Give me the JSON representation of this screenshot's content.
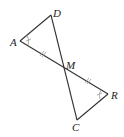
{
  "diagram": {
    "type": "geometry",
    "points": {
      "D": {
        "label": "D",
        "x": 51,
        "y": 15
      },
      "A": {
        "label": "A",
        "x": 20,
        "y": 41
      },
      "M": {
        "label": "M",
        "x": 64,
        "y": 67
      },
      "R": {
        "label": "R",
        "x": 108,
        "y": 94
      },
      "C": {
        "label": "C",
        "x": 77,
        "y": 120
      }
    },
    "segments": [
      [
        "A",
        "D"
      ],
      [
        "D",
        "C"
      ],
      [
        "A",
        "R"
      ],
      [
        "R",
        "C"
      ]
    ],
    "congruence_marks": {
      "angles": [
        "A",
        "R"
      ],
      "segments": [
        "AM",
        "MR"
      ]
    },
    "labels": {
      "D": "D",
      "A": "A",
      "M": "M",
      "R": "R",
      "C": "C"
    }
  }
}
